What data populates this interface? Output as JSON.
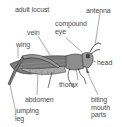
{
  "diagram": {
    "title": "adult locust",
    "subject": "locust",
    "labels": {
      "antenna": "antenna",
      "compound_eye": "compound\neye",
      "vein": "vein",
      "wing": "wing",
      "head": "head",
      "thorax": "thorax",
      "abdomen": "abdomen",
      "jumping_leg": "jumping\nleg",
      "biting_mouth_parts": "biting\nmouth\nparts"
    },
    "colors": {
      "background": "#ffffff",
      "text": "#4a4a4a",
      "outline": "#333333",
      "body_fill": "#9a9a9a",
      "wing_fill": "#7a7a7a"
    }
  }
}
